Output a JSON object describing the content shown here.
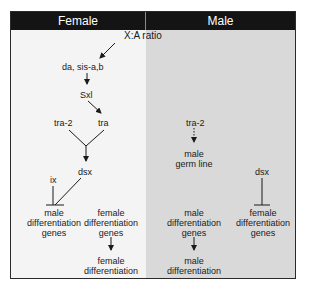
{
  "headers": {
    "female": "Female",
    "male": "Male"
  },
  "colors": {
    "header_bg": "#141414",
    "female_bg": "#f4f4f4",
    "male_bg": "#d9d9d9",
    "text": "#1a1a1a"
  },
  "female": {
    "xa_ratio": "X:A ratio",
    "da_sis": "da, sis-a,b",
    "sxl": "Sxl",
    "tra2": "tra-2",
    "tra": "tra",
    "dsx": "dsx",
    "ix": "ix",
    "male_genes": [
      "male",
      "differentiation",
      "genes"
    ],
    "female_genes": [
      "female",
      "differentiation",
      "genes"
    ],
    "female_diff": [
      "female",
      "differentiation"
    ]
  },
  "male": {
    "tra2": "tra-2",
    "germ_line": [
      "male",
      "germ line"
    ],
    "dsx": "dsx",
    "male_genes": [
      "male",
      "differentiation",
      "genes"
    ],
    "male_diff": [
      "male",
      "differentiation"
    ],
    "female_genes": [
      "female",
      "differentiation",
      "genes"
    ]
  }
}
